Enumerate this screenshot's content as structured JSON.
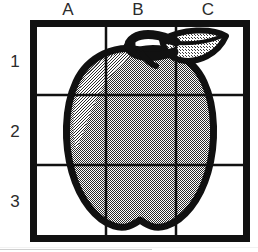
{
  "figure": {
    "background_color": "#ffffff"
  },
  "grid": {
    "columns": [
      {
        "id": "A",
        "label": "A"
      },
      {
        "id": "B",
        "label": "B"
      },
      {
        "id": "C",
        "label": "C"
      }
    ],
    "rows": [
      {
        "id": "1",
        "label": "1"
      },
      {
        "id": "2",
        "label": "2"
      },
      {
        "id": "3",
        "label": "3"
      }
    ],
    "frame_color": "#111111",
    "gridline_color": "#111111",
    "cell_fill": "#ffffff",
    "frame_thickness_px": 7,
    "gridline_thickness_px": 2,
    "column_count": 3,
    "row_count": 3
  },
  "illustration": {
    "name": "apple",
    "body_fill": "#8f8f8f",
    "body_highlight": "#a6a6a6",
    "outline_color": "#111111",
    "outline_thickness_px": 7,
    "leaf_fill": "#b5b5b5",
    "leaf_label": "leaf",
    "stem_label": "stem",
    "body_label": "apple-body",
    "dither": "50% checkerboard"
  }
}
